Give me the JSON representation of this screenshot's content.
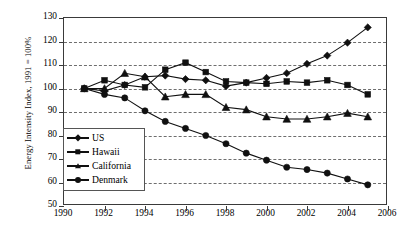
{
  "chart_data": {
    "type": "line",
    "title": "",
    "xlabel": "",
    "ylabel": "Energy Intensity Index, 1991 = 100%",
    "xlim": [
      1990,
      2006
    ],
    "ylim": [
      50,
      130
    ],
    "xticks": [
      "1990",
      "1992",
      "1994",
      "1996",
      "1998",
      "2000",
      "2002",
      "2004",
      "2006"
    ],
    "yticks": [
      "50",
      "60",
      "70",
      "80",
      "90",
      "100",
      "110",
      "120",
      "130"
    ],
    "grid": "horizontal-dashed",
    "legend_position": "lower-left-inside",
    "x": [
      1991,
      1992,
      1993,
      1994,
      1995,
      1996,
      1997,
      1998,
      1999,
      2000,
      2001,
      2002,
      2003,
      2004,
      2005
    ],
    "series": [
      {
        "name": "US",
        "marker": "diamond",
        "values": [
          100,
          99,
          101.5,
          105,
          105.5,
          104,
          103.5,
          101,
          102.5,
          104.5,
          106.5,
          110.5,
          114,
          119.5,
          126
        ]
      },
      {
        "name": "Hawaii",
        "marker": "square",
        "values": [
          100,
          103.5,
          101.5,
          100.5,
          108,
          111,
          107,
          103,
          102.5,
          102,
          103,
          102.5,
          103.5,
          101.5,
          97.5
        ]
      },
      {
        "name": "California",
        "marker": "triangle",
        "values": [
          100,
          100,
          106.5,
          105,
          96.5,
          97.5,
          97.5,
          92,
          91,
          88,
          87,
          87,
          88,
          89.5,
          88
        ]
      },
      {
        "name": "Denmark",
        "marker": "circle",
        "values": [
          100,
          97.5,
          96,
          90.5,
          86,
          83,
          80,
          76.5,
          72.5,
          69.5,
          66.5,
          65.5,
          64,
          61.5,
          59
        ]
      }
    ],
    "colors": {
      "line": "#101010",
      "grid": "#555555",
      "axis": "#3a3a3a",
      "background": "#ffffff"
    }
  },
  "legend": {
    "items": [
      {
        "label": "US"
      },
      {
        "label": "Hawaii"
      },
      {
        "label": "California"
      },
      {
        "label": "Denmark"
      }
    ]
  }
}
